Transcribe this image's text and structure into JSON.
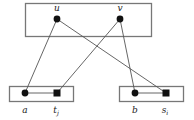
{
  "diagram": {
    "boxes": [
      {
        "id": "top",
        "x": 25,
        "y": 3,
        "w": 126,
        "h": 33
      },
      {
        "id": "bottom-left",
        "x": 9,
        "y": 86,
        "w": 64,
        "h": 15
      },
      {
        "id": "bottom-right",
        "x": 119,
        "y": 86,
        "w": 64,
        "h": 15
      }
    ],
    "nodes": {
      "u": {
        "label": "u",
        "sub": "",
        "shape": "circle",
        "x": 57,
        "y": 19,
        "lx": 57,
        "ly": 11
      },
      "v": {
        "label": "v",
        "sub": "",
        "shape": "circle",
        "x": 120,
        "y": 19,
        "lx": 120,
        "ly": 11
      },
      "a": {
        "label": "a",
        "sub": "",
        "shape": "circle",
        "x": 25,
        "y": 93,
        "lx": 25,
        "ly": 113
      },
      "tj": {
        "label": "t",
        "sub": "j",
        "shape": "square",
        "x": 57,
        "y": 93,
        "lx": 56,
        "ly": 113
      },
      "b": {
        "label": "b",
        "sub": "",
        "shape": "circle",
        "x": 135,
        "y": 93,
        "lx": 135,
        "ly": 113
      },
      "si": {
        "label": "s",
        "sub": "i",
        "shape": "square",
        "x": 166,
        "y": 93,
        "lx": 165,
        "ly": 113
      }
    },
    "edges": [
      [
        "u",
        "a"
      ],
      [
        "u",
        "si"
      ],
      [
        "v",
        "tj"
      ],
      [
        "v",
        "b"
      ],
      [
        "a",
        "tj"
      ],
      [
        "b",
        "si"
      ]
    ],
    "colors": {
      "stroke": "#555555",
      "box": "#777777",
      "node": "#111111"
    }
  }
}
